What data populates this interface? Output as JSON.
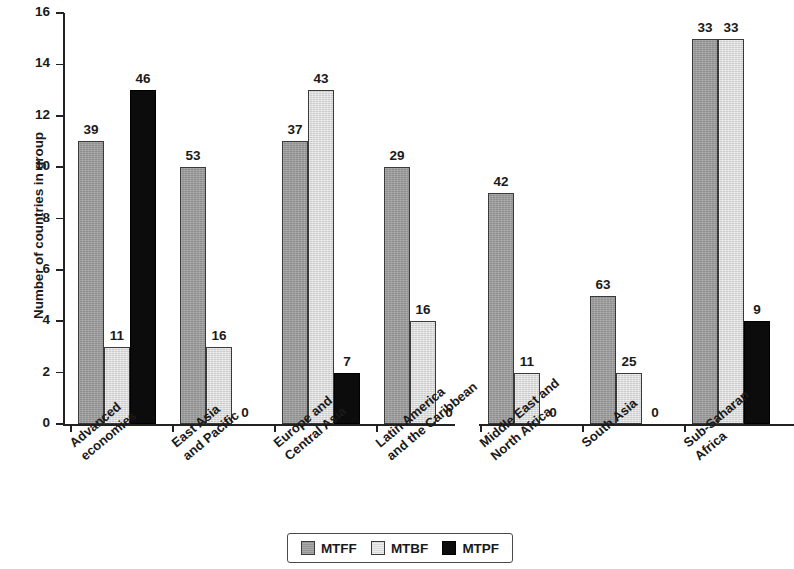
{
  "chart_data": {
    "type": "bar",
    "title": "",
    "subtitle": "",
    "xlabel": "",
    "ylabel": "Number of countries in group",
    "ylim": [
      0,
      16
    ],
    "yticks": [
      0,
      2,
      4,
      6,
      8,
      10,
      12,
      14,
      16
    ],
    "ytick_labels": [
      "0",
      "2",
      "4",
      "6",
      "8",
      "10",
      "12",
      "14",
      "16"
    ],
    "grid": false,
    "legend_position": "bottom",
    "axis_break_after_category_index": 3,
    "categories": [
      "Advanced economies",
      "East Asia and Pacific",
      "Europe and Central Asia",
      "Latin America and the Caribbean",
      "Middle East and North Africa",
      "South Asia",
      "Sub-Saharan Africa"
    ],
    "category_lines": [
      [
        "Advanced",
        "economies"
      ],
      [
        "East Asia",
        "and Pacific"
      ],
      [
        "Europe and",
        "Central Asia"
      ],
      [
        "Latin America",
        "and the Caribbean"
      ],
      [
        "Middle East and",
        "North Africa"
      ],
      [
        "South Asia"
      ],
      [
        "Sub-Saharan",
        "Africa"
      ]
    ],
    "series": [
      {
        "name": "MTFF",
        "color": "#9d9d9d",
        "values": [
          11,
          10,
          11,
          10,
          9,
          5,
          15
        ],
        "data_labels": [
          "39",
          "53",
          "37",
          "29",
          "42",
          "63",
          "33"
        ]
      },
      {
        "name": "MTBF",
        "color": "#dedede",
        "values": [
          3,
          3,
          13,
          4,
          2,
          2,
          15
        ],
        "data_labels": [
          "11",
          "16",
          "43",
          "16",
          "11",
          "25",
          "33"
        ]
      },
      {
        "name": "MTPF",
        "color": "#0c0c0c",
        "values": [
          13,
          0,
          2,
          0,
          0,
          0,
          4
        ],
        "data_labels": [
          "46",
          "0",
          "7",
          "0",
          "0",
          "0",
          "9"
        ]
      }
    ]
  },
  "legend": {
    "items": [
      {
        "label": "MTFF",
        "swatch": "mtff"
      },
      {
        "label": "MTBF",
        "swatch": "mtbf"
      },
      {
        "label": "MTPF",
        "swatch": "mtpf"
      }
    ]
  }
}
